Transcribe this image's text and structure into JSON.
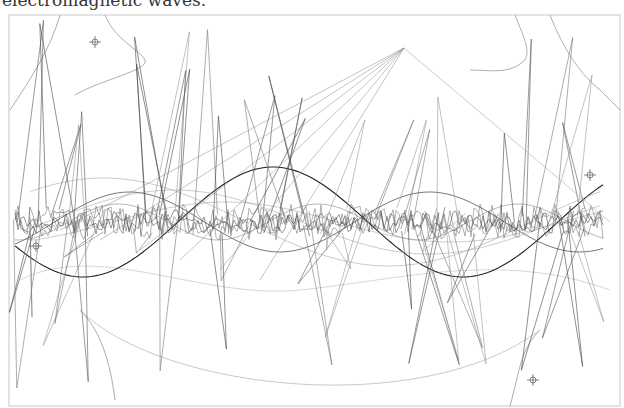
{
  "caption": "electromagnetic waves.",
  "figure": {
    "frame": {
      "x": 9,
      "y": 15,
      "width": 611,
      "height": 391
    },
    "stroke_colors": {
      "dark": "#222222",
      "mid": "#777777",
      "light": "#bbbbbb"
    },
    "markers": [
      {
        "x": 95,
        "y": 42
      },
      {
        "x": 590,
        "y": 175
      },
      {
        "x": 36,
        "y": 246
      },
      {
        "x": 533,
        "y": 380
      }
    ],
    "waves": [
      {
        "amp": 55,
        "period": 380,
        "phase": 0.2,
        "color": "#222222",
        "width": 1.1
      },
      {
        "amp": 30,
        "period": 300,
        "phase": 2.0,
        "color": "#555555",
        "width": 0.8
      },
      {
        "amp": 18,
        "period": 200,
        "phase": 1.0,
        "color": "#888888",
        "width": 0.6
      }
    ],
    "center_y": 222
  }
}
